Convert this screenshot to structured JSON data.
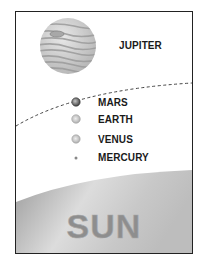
{
  "diagram": {
    "type": "solar-system-order",
    "planets": [
      {
        "name": "JUPITER",
        "order": 1
      },
      {
        "name": "MARS",
        "order": 2
      },
      {
        "name": "EARTH",
        "order": 3
      },
      {
        "name": "VENUS",
        "order": 4
      },
      {
        "name": "MERCURY",
        "order": 5
      }
    ],
    "star": {
      "name": "SUN"
    },
    "boundary": "dashed curve between Jupiter and Mars",
    "colors": {
      "border": "#222222",
      "sun_gradient_light": "#f4f4f4",
      "sun_gradient_dark": "#8a8a8a",
      "sun_text": "#8e8e8e",
      "dashed_line": "#444444"
    }
  }
}
